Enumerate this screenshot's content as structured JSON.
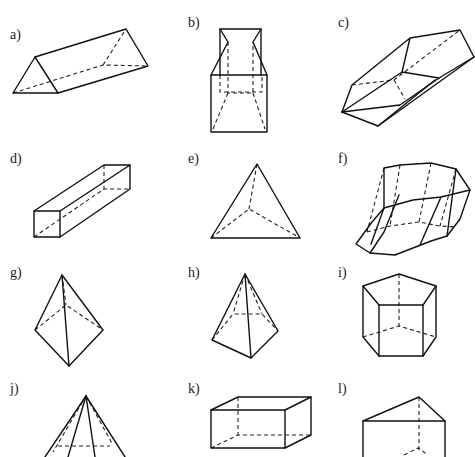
{
  "figures": [
    {
      "id": "a",
      "label": "a)",
      "label_pos": [
        10,
        28
      ],
      "name": "triangular-prism",
      "solid": [
        [
          [
            13,
            93
          ],
          [
            35,
            57
          ],
          [
            58,
            93
          ],
          [
            13,
            93
          ]
        ],
        [
          [
            35,
            57
          ],
          [
            126,
            29
          ],
          [
            148,
            66
          ],
          [
            58,
            93
          ]
        ]
      ],
      "dash": [
        [
          [
            13,
            93
          ],
          [
            103,
            65
          ],
          [
            148,
            66
          ]
        ],
        [
          [
            103,
            65
          ],
          [
            126,
            29
          ]
        ]
      ]
    },
    {
      "id": "b",
      "label": "b)",
      "label_pos": [
        188,
        16
      ],
      "name": "composite-box-frustum",
      "solid": [
        [
          [
            211,
            75
          ],
          [
            267,
            75
          ],
          [
            267,
            132
          ],
          [
            211,
            132
          ],
          [
            211,
            75
          ]
        ],
        [
          [
            211,
            75
          ],
          [
            228,
            42
          ],
          [
            220,
            29
          ],
          [
            261,
            29
          ],
          [
            253,
            42
          ],
          [
            267,
            75
          ]
        ],
        [
          [
            220,
            29
          ],
          [
            220,
            75
          ]
        ],
        [
          [
            261,
            29
          ],
          [
            261,
            75
          ]
        ]
      ],
      "dash": [
        [
          [
            228,
            42
          ],
          [
            228,
            93
          ],
          [
            253,
            93
          ],
          [
            253,
            42
          ]
        ],
        [
          [
            220,
            75
          ],
          [
            220,
            92
          ],
          [
            262,
            92
          ],
          [
            262,
            75
          ]
        ],
        [
          [
            228,
            93
          ],
          [
            213,
            129
          ]
        ],
        [
          [
            253,
            93
          ],
          [
            265,
            129
          ]
        ]
      ]
    },
    {
      "id": "c",
      "label": "c)",
      "label_pos": [
        338,
        16
      ],
      "name": "hexagonal-prism-oblique",
      "solid": [
        [
          [
            342,
            112
          ],
          [
            352,
            85
          ],
          [
            410,
            38
          ],
          [
            460,
            30
          ],
          [
            474,
            57
          ],
          [
            439,
            78
          ],
          [
            402,
            72
          ],
          [
            410,
            38
          ]
        ],
        [
          [
            342,
            112
          ],
          [
            402,
            72
          ]
        ],
        [
          [
            342,
            112
          ],
          [
            378,
            126
          ],
          [
            474,
            57
          ]
        ],
        [
          [
            378,
            126
          ],
          [
            435,
            80
          ]
        ],
        [
          [
            342,
            112
          ],
          [
            400,
            105
          ],
          [
            439,
            78
          ]
        ]
      ],
      "dash": [
        [
          [
            352,
            85
          ],
          [
            394,
            80
          ],
          [
            460,
            30
          ]
        ],
        [
          [
            394,
            80
          ],
          [
            405,
            99
          ]
        ]
      ]
    },
    {
      "id": "d",
      "label": "d)",
      "label_pos": [
        10,
        152
      ],
      "name": "rectangular-prism",
      "solid": [
        [
          [
            34,
            211
          ],
          [
            60,
            211
          ],
          [
            60,
            237
          ],
          [
            34,
            237
          ],
          [
            34,
            211
          ]
        ],
        [
          [
            34,
            211
          ],
          [
            104,
            165
          ],
          [
            130,
            165
          ],
          [
            60,
            211
          ]
        ],
        [
          [
            130,
            165
          ],
          [
            130,
            189
          ],
          [
            60,
            237
          ]
        ]
      ],
      "dash": [
        [
          [
            34,
            237
          ],
          [
            104,
            189
          ],
          [
            130,
            189
          ]
        ],
        [
          [
            104,
            165
          ],
          [
            104,
            189
          ]
        ]
      ]
    },
    {
      "id": "e",
      "label": "e)",
      "label_pos": [
        188,
        152
      ],
      "name": "tetrahedron",
      "solid": [
        [
          [
            211,
            238
          ],
          [
            257,
            164
          ],
          [
            300,
            238
          ],
          [
            211,
            238
          ]
        ]
      ],
      "dash": [
        [
          [
            257,
            164
          ],
          [
            249,
            209
          ]
        ],
        [
          [
            211,
            238
          ],
          [
            249,
            209
          ],
          [
            300,
            238
          ]
        ]
      ]
    },
    {
      "id": "f",
      "label": "f)",
      "label_pos": [
        338,
        152
      ],
      "name": "octagonal-prism-oblique",
      "solid": [
        [
          [
            384,
            168
          ],
          [
            400,
            165
          ],
          [
            431,
            163
          ],
          [
            456,
            169
          ],
          [
            470,
            190
          ],
          [
            441,
            197
          ],
          [
            413,
            200
          ],
          [
            384,
            208
          ],
          [
            384,
            168
          ]
        ],
        [
          [
            384,
            208
          ],
          [
            372,
            222
          ],
          [
            356,
            244
          ],
          [
            370,
            253
          ],
          [
            395,
            255
          ],
          [
            431,
            241
          ],
          [
            447,
            236
          ],
          [
            460,
            219
          ],
          [
            470,
            190
          ]
        ],
        [
          [
            384,
            208
          ],
          [
            371,
            244
          ]
        ],
        [
          [
            399,
            195
          ],
          [
            384,
            232
          ],
          [
            370,
            253
          ]
        ],
        [
          [
            441,
            197
          ],
          [
            420,
            245
          ]
        ],
        [
          [
            456,
            169
          ],
          [
            447,
            236
          ]
        ]
      ],
      "dash": [
        [
          [
            367,
            232
          ],
          [
            390,
            226
          ],
          [
            419,
            222
          ],
          [
            440,
            226
          ],
          [
            456,
            227
          ]
        ],
        [
          [
            431,
            163
          ],
          [
            419,
            222
          ]
        ],
        [
          [
            400,
            165
          ],
          [
            390,
            226
          ]
        ],
        [
          [
            456,
            169
          ],
          [
            440,
            226
          ]
        ],
        [
          [
            384,
            168
          ],
          [
            367,
            232
          ]
        ]
      ]
    },
    {
      "id": "g",
      "label": "g)",
      "label_pos": [
        10,
        266
      ],
      "name": "triangular-pyramid",
      "solid": [
        [
          [
            62,
            275
          ],
          [
            35,
            330
          ],
          [
            69,
            366
          ],
          [
            103,
            330
          ],
          [
            62,
            275
          ]
        ],
        [
          [
            62,
            275
          ],
          [
            69,
            366
          ]
        ]
      ],
      "dash": [
        [
          [
            35,
            330
          ],
          [
            66,
            305
          ],
          [
            103,
            330
          ]
        ],
        [
          [
            62,
            275
          ],
          [
            66,
            305
          ]
        ]
      ]
    },
    {
      "id": "h",
      "label": "h)",
      "label_pos": [
        188,
        266
      ],
      "name": "square-pyramid",
      "solid": [
        [
          [
            245,
            274
          ],
          [
            212,
            340
          ],
          [
            251,
            358
          ],
          [
            278,
            331
          ],
          [
            245,
            274
          ]
        ],
        [
          [
            245,
            274
          ],
          [
            251,
            358
          ]
        ]
      ],
      "dash": [
        [
          [
            212,
            340
          ],
          [
            233,
            314
          ],
          [
            262,
            314
          ],
          [
            278,
            331
          ]
        ],
        [
          [
            245,
            274
          ],
          [
            233,
            314
          ]
        ],
        [
          [
            245,
            274
          ],
          [
            262,
            314
          ]
        ]
      ]
    },
    {
      "id": "i",
      "label": "i)",
      "label_pos": [
        338,
        266
      ],
      "name": "pentagonal-prism",
      "solid": [
        [
          [
            363,
            286
          ],
          [
            399,
            274
          ],
          [
            436,
            286
          ],
          [
            423,
            305
          ],
          [
            379,
            305
          ],
          [
            363,
            286
          ]
        ],
        [
          [
            363,
            286
          ],
          [
            363,
            337
          ],
          [
            379,
            356
          ],
          [
            423,
            356
          ],
          [
            436,
            337
          ],
          [
            436,
            286
          ]
        ],
        [
          [
            379,
            305
          ],
          [
            379,
            356
          ]
        ],
        [
          [
            423,
            305
          ],
          [
            423,
            356
          ]
        ]
      ],
      "dash": [
        [
          [
            363,
            337
          ],
          [
            399,
            326
          ],
          [
            436,
            337
          ]
        ],
        [
          [
            399,
            274
          ],
          [
            399,
            326
          ]
        ]
      ]
    },
    {
      "id": "j",
      "label": "j)",
      "label_pos": [
        10,
        382
      ],
      "name": "polygonal-pyramid-partial",
      "solid": [
        [
          [
            86,
            396
          ],
          [
            45,
            457
          ]
        ],
        [
          [
            86,
            396
          ],
          [
            68,
            457
          ]
        ],
        [
          [
            86,
            396
          ],
          [
            95,
            457
          ]
        ],
        [
          [
            86,
            396
          ],
          [
            125,
            457
          ]
        ]
      ],
      "dash": [
        [
          [
            86,
            396
          ],
          [
            53,
            452
          ]
        ],
        [
          [
            86,
            396
          ],
          [
            113,
            445
          ]
        ],
        [
          [
            58,
            446
          ],
          [
            110,
            446
          ]
        ]
      ]
    },
    {
      "id": "k",
      "label": "k)",
      "label_pos": [
        188,
        382
      ],
      "name": "cuboid",
      "solid": [
        [
          [
            211,
            410
          ],
          [
            285,
            410
          ],
          [
            285,
            448
          ],
          [
            211,
            448
          ],
          [
            211,
            410
          ]
        ],
        [
          [
            211,
            410
          ],
          [
            238,
            397
          ],
          [
            311,
            397
          ],
          [
            285,
            410
          ]
        ],
        [
          [
            311,
            397
          ],
          [
            311,
            435
          ],
          [
            285,
            448
          ]
        ]
      ],
      "dash": [
        [
          [
            211,
            448
          ],
          [
            238,
            435
          ],
          [
            311,
            435
          ]
        ],
        [
          [
            238,
            397
          ],
          [
            238,
            435
          ]
        ]
      ]
    },
    {
      "id": "l",
      "label": "l)",
      "label_pos": [
        338,
        382
      ],
      "name": "triangular-prism-upright",
      "solid": [
        [
          [
            363,
            421
          ],
          [
            419,
            397
          ],
          [
            445,
            421
          ],
          [
            363,
            421
          ]
        ],
        [
          [
            363,
            421
          ],
          [
            363,
            457
          ]
        ],
        [
          [
            445,
            421
          ],
          [
            445,
            457
          ]
        ]
      ],
      "dash": [
        [
          [
            419,
            397
          ],
          [
            419,
            450
          ]
        ],
        [
          [
            404,
            455
          ],
          [
            418,
            448
          ],
          [
            428,
            455
          ]
        ]
      ]
    }
  ]
}
